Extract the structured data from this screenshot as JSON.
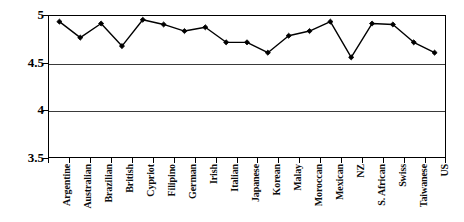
{
  "chart_data": {
    "type": "line",
    "title": "",
    "subtitle": "",
    "xlabel": "",
    "ylabel": "",
    "ylim": [
      3.5,
      5.0
    ],
    "y_ticks": [
      "3.5",
      "4",
      "4.5",
      "5"
    ],
    "y_tick_values": [
      3.5,
      4.0,
      4.5,
      5.0
    ],
    "grid": true,
    "grid_axis": "y",
    "legend": false,
    "legend_position": "none",
    "marker": "filled-diamond",
    "line_color": "#000000",
    "marker_color": "#000000",
    "categories": [
      "Argentine",
      "Australian",
      "Brazilian",
      "British",
      "Cypriot",
      "Filipino",
      "German",
      "Irish",
      "Italian",
      "Japanese",
      "Korean",
      "Malay",
      "Moroccan",
      "Mexican",
      "NZ",
      "S. African",
      "Swiss",
      "Taiwanese",
      "US"
    ],
    "values": [
      4.94,
      4.77,
      4.92,
      4.68,
      4.96,
      4.91,
      4.84,
      4.88,
      4.72,
      4.72,
      4.61,
      4.79,
      4.84,
      4.94,
      4.56,
      4.92,
      4.91,
      4.72,
      4.61
    ],
    "series": [
      {
        "name": "",
        "values": [
          4.94,
          4.77,
          4.92,
          4.68,
          4.96,
          4.91,
          4.84,
          4.88,
          4.72,
          4.72,
          4.61,
          4.79,
          4.84,
          4.94,
          4.56,
          4.92,
          4.91,
          4.72,
          4.61
        ]
      }
    ]
  }
}
